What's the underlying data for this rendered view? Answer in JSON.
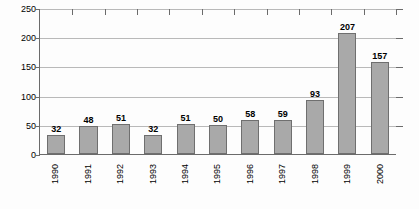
{
  "chart_data": {
    "type": "bar",
    "title": "",
    "subtitle": "",
    "xlabel": "",
    "ylabel": "",
    "categories": [
      "1990",
      "1991",
      "1992",
      "1993",
      "1994",
      "1995",
      "1996",
      "1997",
      "1998",
      "1999",
      "2000"
    ],
    "values": [
      32,
      48,
      51,
      32,
      51,
      50,
      58,
      59,
      93,
      207,
      157
    ],
    "series": [
      {
        "name": "",
        "values": [
          32,
          48,
          51,
          32,
          51,
          50,
          58,
          59,
          93,
          207,
          157
        ]
      }
    ],
    "data_labels": [
      "32",
      "48",
      "51",
      "32",
      "51",
      "50",
      "58",
      "59",
      "93",
      "207",
      "157"
    ],
    "ylim": [
      0,
      250
    ],
    "y_ticks": [
      0,
      50,
      100,
      150,
      200,
      250
    ],
    "y_tick_labels": [
      "0",
      "50",
      "100",
      "150",
      "200",
      "250"
    ],
    "grid": true,
    "grid_axis": "y",
    "legend": false,
    "legend_position": "none",
    "colors": {
      "bar_fill": "#a9a9a9",
      "bar_border": "#6f6f6f",
      "gridline": "#b9b9b9",
      "axis": "#6b6b6b",
      "text": "#000000",
      "background": "#fdfdfd"
    }
  }
}
